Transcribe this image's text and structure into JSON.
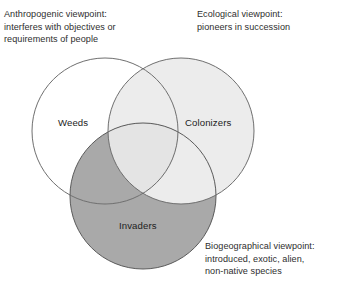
{
  "figure": {
    "type": "venn-diagram",
    "background_color": "#ffffff",
    "set_count": 3
  },
  "annotations": {
    "anthropogenic": "Anthropogenic viewpoint:\ninterferes with objectives or\nrequirements of people",
    "ecological": "Ecological viewpoint:\npioneers in succession",
    "biogeographical": "Biogeographical viewpoint:\nintroduced, exotic, alien,\nnon-native species"
  },
  "sets": {
    "weeds": {
      "label": "Weeds",
      "fill": "#ffffff",
      "stroke": "#6f6f6f",
      "cx": 105,
      "cy": 131,
      "r": 73
    },
    "colonizers": {
      "label": "Colonizers",
      "fill": "#ececec",
      "stroke": "#6f6f6f",
      "cx": 181,
      "cy": 131,
      "r": 73
    },
    "invaders": {
      "label": "Invaders",
      "fill": "#a9a9a9",
      "stroke": "#5a5a5a",
      "cx": 143,
      "cy": 196,
      "r": 73
    }
  },
  "colors": {
    "text": "#2e2e2e",
    "label_text": "#1d1d1d",
    "outline": "#6f6f6f",
    "light_fill": "#ececec",
    "dark_fill": "#a9a9a9",
    "page": "#ffffff"
  }
}
